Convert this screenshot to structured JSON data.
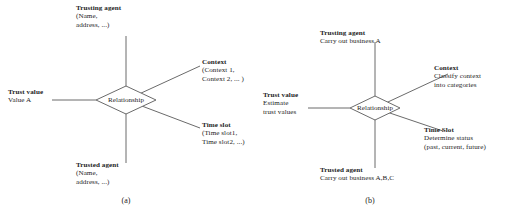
{
  "figure": {
    "panels": [
      {
        "id": "a",
        "caption": "(a)",
        "center_node": "Relationship",
        "nodes": {
          "trusting_agent": {
            "heading": "Trusting agent",
            "detail_line1": "(Name,",
            "detail_line2": "address, ...)"
          },
          "context": {
            "heading": "Context",
            "detail_line1": "(Context 1,",
            "detail_line2": "Context 2, ... )"
          },
          "time_slot": {
            "heading": "Time slot",
            "detail_line1": "(Time slot1,",
            "detail_line2": "Time slot2, ...)"
          },
          "trusted_agent": {
            "heading": "Trusted agent",
            "detail_line1": "(Name,",
            "detail_line2": "address, ...)"
          },
          "trust_value": {
            "heading": "Trust value",
            "detail_line1": "Value A",
            "detail_line2": ""
          }
        }
      },
      {
        "id": "b",
        "caption": "(b)",
        "center_node": "Relationship",
        "nodes": {
          "trusting_agent": {
            "heading": "Trusting agent",
            "detail_line1": "Carry out business A",
            "detail_line2": ""
          },
          "context": {
            "heading": "Context",
            "detail_line1": "Classify context",
            "detail_line2": "into categories"
          },
          "time_slot": {
            "heading": "Time Slot",
            "detail_line1": "Determine status",
            "detail_line2": "(past, current, future)"
          },
          "trusted_agent": {
            "heading": "Trusted agent",
            "detail_line1": "Carry out business A,B,C",
            "detail_line2": ""
          },
          "trust_value": {
            "heading": "Trust value",
            "detail_line1": "Estimate",
            "detail_line2": "trust values"
          }
        }
      }
    ],
    "colors": {
      "line": "#6b6b6b",
      "text": "#1d1d1d",
      "background": "#ffffff"
    }
  }
}
